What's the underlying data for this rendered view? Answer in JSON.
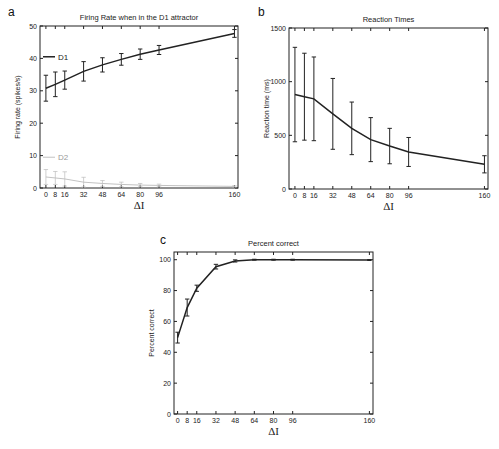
{
  "chart_data": [
    {
      "panel": "a",
      "type": "line",
      "title": "Firing Rate when in the D1 attractor",
      "xlabel": "ΔI",
      "ylabel": "Firing rate (spikes/s)",
      "x": [
        0,
        8,
        16,
        32,
        48,
        64,
        80,
        96,
        160
      ],
      "xticks": [
        0,
        8,
        16,
        32,
        48,
        64,
        80,
        96,
        160
      ],
      "yticks": [
        0,
        10,
        20,
        30,
        40,
        50
      ],
      "xlim": [
        -5,
        163
      ],
      "ylim": [
        0,
        50
      ],
      "legend_position": "inside-left",
      "series": [
        {
          "name": "D1",
          "color": "#222222",
          "values": [
            30.8,
            32.0,
            33.3,
            36.0,
            38.0,
            39.7,
            41.3,
            42.6,
            47.7
          ],
          "err": [
            4.0,
            3.8,
            2.8,
            3.0,
            2.2,
            1.8,
            1.6,
            1.4,
            1.2
          ]
        },
        {
          "name": "D2",
          "color": "#bbbbbb",
          "values": [
            3.4,
            3.1,
            2.8,
            1.8,
            1.4,
            1.1,
            0.9,
            0.8,
            0.5
          ],
          "err": [
            2.3,
            2.0,
            2.2,
            1.5,
            0.9,
            0.7,
            0.5,
            0.4,
            0.2
          ]
        }
      ]
    },
    {
      "panel": "b",
      "type": "line",
      "title": "Reaction Times",
      "xlabel": "ΔI",
      "ylabel": "Reaction time (ms)",
      "x": [
        0,
        8,
        16,
        32,
        48,
        64,
        80,
        96,
        160
      ],
      "xticks": [
        0,
        8,
        16,
        32,
        48,
        64,
        80,
        96,
        160
      ],
      "yticks": [
        0,
        500,
        1000,
        1500
      ],
      "xlim": [
        -5,
        163
      ],
      "ylim": [
        0,
        1500
      ],
      "series": [
        {
          "name": "RT",
          "color": "#222222",
          "values": [
            880,
            860,
            840,
            700,
            565,
            460,
            400,
            345,
            230
          ],
          "err": [
            440,
            405,
            390,
            330,
            245,
            205,
            165,
            135,
            80
          ]
        }
      ]
    },
    {
      "panel": "c",
      "type": "line",
      "title": "Percent correct",
      "xlabel": "ΔI",
      "ylabel": "Percent correct",
      "x": [
        0,
        8,
        16,
        32,
        48,
        64,
        80,
        96,
        160
      ],
      "xticks": [
        0,
        8,
        16,
        32,
        48,
        64,
        80,
        96,
        160
      ],
      "yticks": [
        0,
        20,
        40,
        60,
        80,
        100
      ],
      "xlim": [
        -3,
        163
      ],
      "ylim": [
        0,
        105
      ],
      "series": [
        {
          "name": "Correct",
          "color": "#222222",
          "values": [
            49.5,
            69,
            81.5,
            95.5,
            99.2,
            100,
            100,
            100,
            99.8
          ],
          "err": [
            3.5,
            5.5,
            2,
            1.5,
            0.7,
            0.3,
            0.3,
            0.3,
            0.3
          ]
        }
      ]
    }
  ],
  "layout": {
    "panels": [
      {
        "left": 40,
        "right": 238,
        "top": 26,
        "bottom": 188,
        "letter_x": 8,
        "letter_y": 16
      },
      {
        "left": 289,
        "right": 488,
        "top": 28,
        "bottom": 189,
        "letter_x": 258,
        "letter_y": 16
      },
      {
        "left": 174,
        "right": 373,
        "top": 252,
        "bottom": 414,
        "letter_x": 160,
        "letter_y": 244
      }
    ]
  }
}
